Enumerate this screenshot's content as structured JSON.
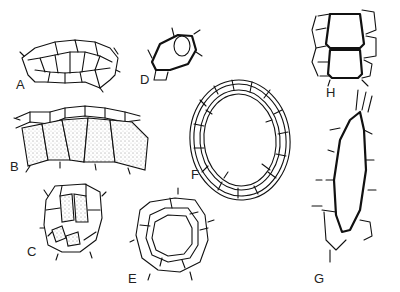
{
  "figure": {
    "panels": [
      {
        "id": "A",
        "label": "A",
        "subject": "arched layer of polygonal cells"
      },
      {
        "id": "B",
        "label": "B",
        "subject": "epidermal row over stippled cell layer"
      },
      {
        "id": "C",
        "label": "C",
        "subject": "small cell cluster with stippled inner cells"
      },
      {
        "id": "D",
        "label": "D",
        "subject": "single thick-walled cell with nucleus"
      },
      {
        "id": "E",
        "label": "E",
        "subject": "ring of cells around a lumen"
      },
      {
        "id": "F",
        "label": "F",
        "subject": "large ring-shaped tissue cross-section"
      },
      {
        "id": "G",
        "label": "G",
        "subject": "elongated thick-walled cell with neighbouring cells"
      },
      {
        "id": "H",
        "label": "H",
        "subject": "two stacked thick-walled cells with side cells"
      }
    ]
  }
}
